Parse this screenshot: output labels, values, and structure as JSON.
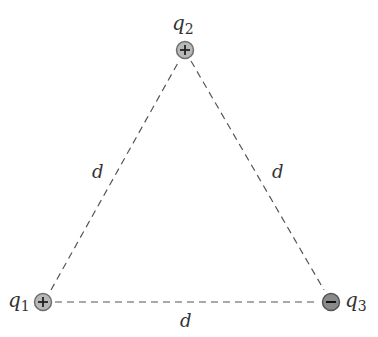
{
  "diagram": {
    "type": "equilateral-triangle-charges",
    "charges": [
      {
        "id": "q1",
        "name": "q",
        "subscript": "1",
        "sign": "+",
        "fill": "#b8b8b8",
        "cx": 43,
        "cy": 302
      },
      {
        "id": "q2",
        "name": "q",
        "subscript": "2",
        "sign": "+",
        "fill": "#b8b8b8",
        "cx": 185,
        "cy": 50
      },
      {
        "id": "q3",
        "name": "q",
        "subscript": "3",
        "sign": "−",
        "fill": "#8a8a8a",
        "cx": 331,
        "cy": 302
      }
    ],
    "sides": [
      {
        "from": "q1",
        "to": "q2",
        "label": "d"
      },
      {
        "from": "q2",
        "to": "q3",
        "label": "d"
      },
      {
        "from": "q1",
        "to": "q3",
        "label": "d"
      }
    ]
  }
}
